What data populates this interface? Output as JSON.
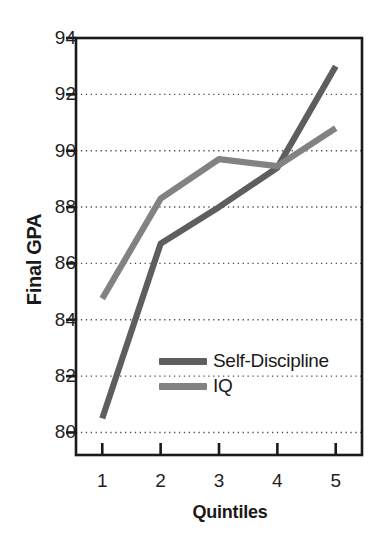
{
  "chart_data": {
    "type": "line",
    "title": "",
    "subtitle": "",
    "xlabel": "Quintiles",
    "ylabel": "Final GPA",
    "categories": [
      "1",
      "2",
      "3",
      "4",
      "5"
    ],
    "x": [
      1,
      2,
      3,
      4,
      5
    ],
    "xlim": [
      0.55,
      5.45
    ],
    "ylim": [
      79.2,
      94
    ],
    "xticks": [
      "1",
      "2",
      "3",
      "4",
      "5"
    ],
    "yticks": [
      "80",
      "82",
      "84",
      "86",
      "88",
      "90",
      "92",
      "94"
    ],
    "ytick_values": [
      80,
      82,
      84,
      86,
      88,
      90,
      92,
      94
    ],
    "grid": "horizontal-dotted",
    "legend_position": "inside-lower-center",
    "series": [
      {
        "name": "Self-Discipline",
        "color": "#5e5e5e",
        "values": [
          80.5,
          86.7,
          88.0,
          89.4,
          93.0
        ]
      },
      {
        "name": "IQ",
        "color": "#828282",
        "values": [
          84.75,
          88.3,
          89.7,
          89.45,
          90.8
        ]
      }
    ],
    "axis_color": "#1a1a1a",
    "grid_color": "#4d4d4d",
    "background": "#ffffff"
  },
  "axes": {
    "y_title": "Final GPA",
    "x_title": "Quintiles"
  },
  "legend": {
    "items": [
      {
        "label": "Self-Discipline",
        "color": "#5e5e5e"
      },
      {
        "label": "IQ",
        "color": "#828282"
      }
    ]
  }
}
